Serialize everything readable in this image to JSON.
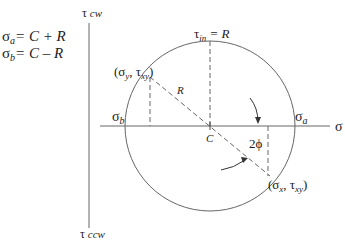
{
  "diagram": {
    "equations": [
      {
        "lhs": "σ",
        "sub": "a",
        "rhs": "= C + R"
      },
      {
        "lhs": "σ",
        "sub": "b",
        "rhs": "= C – R"
      }
    ],
    "axes": {
      "vertical_top": {
        "symbol": "τ",
        "sub": "cw"
      },
      "vertical_bottom": {
        "symbol": "τ",
        "sub": "ccw"
      },
      "horizontal": "σ"
    },
    "labels": {
      "tau_in": {
        "symbol": "τ",
        "sub": "in",
        "rhs": " = R"
      },
      "point_y": {
        "open": "(σ",
        "sub1": "y",
        "mid": ", τ",
        "sub2": "xy",
        "close": ")"
      },
      "point_x": {
        "open": "(σ",
        "sub1": "x",
        "mid": ", τ",
        "sub2": "xy",
        "close": ")"
      },
      "radius": "R",
      "center": "C",
      "sigma_a": {
        "symbol": "σ",
        "sub": "a"
      },
      "sigma_b": {
        "symbol": "σ",
        "sub": "b"
      },
      "angle": "2ϕ"
    },
    "colors": {
      "line": "#555555",
      "text": "#222222"
    }
  }
}
